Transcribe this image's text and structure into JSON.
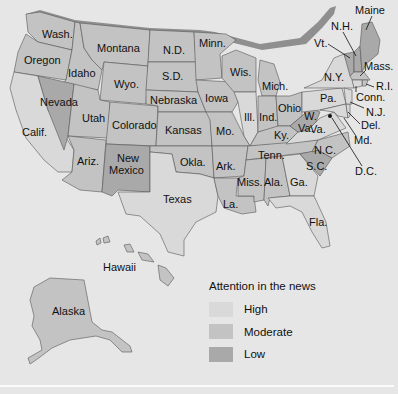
{
  "legend": {
    "title": "Attention in the news",
    "items": [
      {
        "key": "high",
        "label": "High",
        "color": "#d9d9d9"
      },
      {
        "key": "moderate",
        "label": "Moderate",
        "color": "#c3c3c3"
      },
      {
        "key": "low",
        "label": "Low",
        "color": "#a9a9a9"
      }
    ]
  },
  "colors": {
    "background": "#e6e6e6",
    "high": "#d9d9d9",
    "moderate": "#c3c3c3",
    "low": "#a9a9a9",
    "border": "#555555"
  },
  "states": {
    "wash": {
      "label": "Wash.",
      "level": "moderate"
    },
    "oregon": {
      "label": "Oregon",
      "level": "moderate"
    },
    "calif": {
      "label": "Calif.",
      "level": "high"
    },
    "idaho": {
      "label": "Idaho",
      "level": "moderate"
    },
    "nevada": {
      "label": "Nevada",
      "level": "low"
    },
    "montana": {
      "label": "Montana",
      "level": "moderate"
    },
    "wyo": {
      "label": "Wyo.",
      "level": "moderate"
    },
    "utah": {
      "label": "Utah",
      "level": "moderate"
    },
    "ariz": {
      "label": "Ariz.",
      "level": "moderate"
    },
    "colorado": {
      "label": "Colorado",
      "level": "moderate"
    },
    "new_mexico": {
      "label_1": "New",
      "label_2": "Mexico",
      "level": "low"
    },
    "nd": {
      "label": "N.D.",
      "level": "moderate"
    },
    "sd": {
      "label": "S.D.",
      "level": "moderate"
    },
    "nebraska": {
      "label": "Nebraska",
      "level": "moderate"
    },
    "kansas": {
      "label": "Kansas",
      "level": "moderate"
    },
    "okla": {
      "label": "Okla.",
      "level": "moderate"
    },
    "texas": {
      "label": "Texas",
      "level": "high"
    },
    "minn": {
      "label": "Minn.",
      "level": "moderate"
    },
    "iowa": {
      "label": "Iowa",
      "level": "moderate"
    },
    "mo": {
      "label": "Mo.",
      "level": "moderate"
    },
    "ark": {
      "label": "Ark.",
      "level": "moderate"
    },
    "la": {
      "label": "La.",
      "level": "moderate"
    },
    "wis": {
      "label": "Wis.",
      "level": "moderate"
    },
    "ill": {
      "label": "Ill.",
      "level": "high"
    },
    "mich": {
      "label": "Mich.",
      "level": "moderate"
    },
    "ind": {
      "label": "Ind.",
      "level": "moderate"
    },
    "ohio": {
      "label": "Ohio",
      "level": "moderate"
    },
    "ky": {
      "label": "Ky.",
      "level": "moderate"
    },
    "tenn": {
      "label": "Tenn.",
      "level": "moderate"
    },
    "miss": {
      "label": "Miss.",
      "level": "moderate"
    },
    "ala": {
      "label": "Ala.",
      "level": "moderate"
    },
    "ga": {
      "label": "Ga.",
      "level": "high"
    },
    "fla": {
      "label": "Fla.",
      "level": "high"
    },
    "sc": {
      "label": "S.C.",
      "level": "low"
    },
    "nc": {
      "label": "N.C.",
      "level": "moderate"
    },
    "va": {
      "label": "Va.",
      "level": "high"
    },
    "wva": {
      "label_1": "W.",
      "label_2": "Va.",
      "level": "low"
    },
    "pa": {
      "label": "Pa.",
      "level": "high"
    },
    "ny": {
      "label": "N.Y.",
      "level": "high"
    },
    "vt": {
      "label": "Vt.",
      "level": "low"
    },
    "nh": {
      "label": "N.H.",
      "level": "low"
    },
    "maine": {
      "label": "Maine",
      "level": "low"
    },
    "mass": {
      "label": "Mass.",
      "level": "moderate"
    },
    "ri": {
      "label": "R.I.",
      "level": "moderate"
    },
    "conn": {
      "label": "Conn.",
      "level": "high"
    },
    "nj": {
      "label": "N.J.",
      "level": "high"
    },
    "del": {
      "label": "Del.",
      "level": "high"
    },
    "md": {
      "label": "Md.",
      "level": "high"
    },
    "dc": {
      "label": "D.C.",
      "level": "high"
    },
    "hawaii": {
      "label": "Hawaii",
      "level": "moderate"
    },
    "alaska": {
      "label": "Alaska",
      "level": "moderate"
    }
  }
}
